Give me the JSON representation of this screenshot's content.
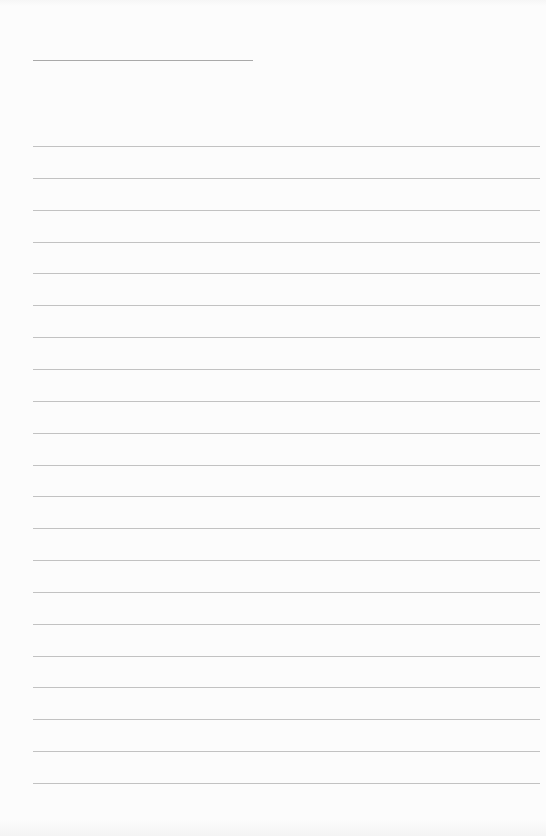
{
  "document": {
    "type": "lined-paper",
    "title_line": {
      "x": 33,
      "y": 60,
      "width": 220,
      "text": ""
    },
    "ruled_lines": {
      "count": 21,
      "first_y": 146,
      "spacing": 31.85,
      "x": 33,
      "width": 507,
      "entries": [
        "",
        "",
        "",
        "",
        "",
        "",
        "",
        "",
        "",
        "",
        "",
        "",
        "",
        "",
        "",
        "",
        "",
        "",
        "",
        "",
        ""
      ]
    },
    "colors": {
      "background": "#fbfbfb",
      "title_line": "#a9a9a9",
      "rule_line": "#c2c2c2"
    }
  }
}
